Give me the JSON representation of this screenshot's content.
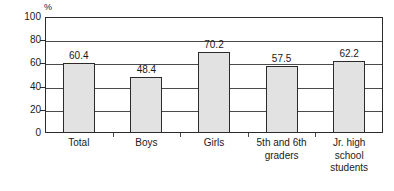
{
  "chart_data": {
    "type": "bar",
    "title": "",
    "subtitle": "",
    "xlabel": "",
    "ylabel": "%",
    "unit": "%",
    "categories": [
      "Total",
      "Boys",
      "Girls",
      "5th and 6th graders",
      "Jr. high school students"
    ],
    "category_lines": [
      [
        "Total"
      ],
      [
        "Boys"
      ],
      [
        "Girls"
      ],
      [
        "5th and 6th",
        "graders"
      ],
      [
        "Jr. high",
        "school",
        "students"
      ]
    ],
    "values": [
      60.4,
      48.4,
      70.2,
      57.5,
      62.2
    ],
    "value_labels": [
      "60.4",
      "48.4",
      "70.2",
      "57.5",
      "62.2"
    ],
    "ylim": [
      0,
      100
    ],
    "yticks": [
      0,
      20,
      40,
      60,
      80,
      100
    ],
    "ytick_labels": [
      "0",
      "20",
      "40",
      "60",
      "80",
      "100"
    ],
    "grid": true,
    "legend": false,
    "legend_position": "none",
    "bar_color": "#e2e2e2",
    "bar_border_color": "#2b2b2b",
    "grid_color": "#4a4a4a",
    "text_color": "#1a1a1a"
  }
}
